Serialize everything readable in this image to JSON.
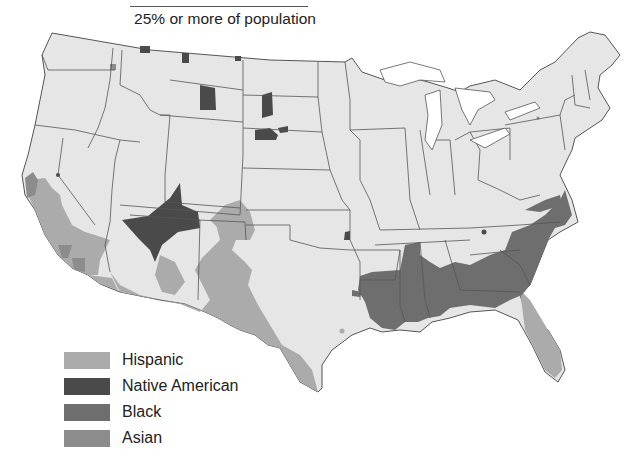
{
  "header": {
    "subtitle": "25% or more of population"
  },
  "legend": {
    "items": [
      {
        "label": "Hispanic",
        "color": "#ababab"
      },
      {
        "label": "Native American",
        "color": "#4a4a4a"
      },
      {
        "label": "Black",
        "color": "#6e6e6e"
      },
      {
        "label": "Asian",
        "color": "#8c8c8c"
      }
    ]
  },
  "map": {
    "base_color": "#e6e6e6",
    "border_color": "#555555",
    "region": "Contiguous United States",
    "regions": [
      {
        "group": "Hispanic",
        "areas": [
          "Southern California",
          "Arizona (southwest)",
          "New Mexico",
          "Southern Colorado",
          "West and South Texas",
          "South Florida"
        ]
      },
      {
        "group": "Native American",
        "areas": [
          "Four Corners (Arizona/Utah/New Mexico)",
          "Montana reservations",
          "North Dakota",
          "South Dakota",
          "Eastern Oklahoma"
        ]
      },
      {
        "group": "Black",
        "areas": [
          "Mississippi Delta",
          "Louisiana",
          "Mississippi",
          "Alabama",
          "Georgia",
          "South Carolina",
          "North Carolina",
          "Southern Virginia"
        ]
      },
      {
        "group": "Asian",
        "areas": [
          "San Francisco Bay Area",
          "Los Angeles",
          "Northern Washington"
        ]
      }
    ]
  }
}
